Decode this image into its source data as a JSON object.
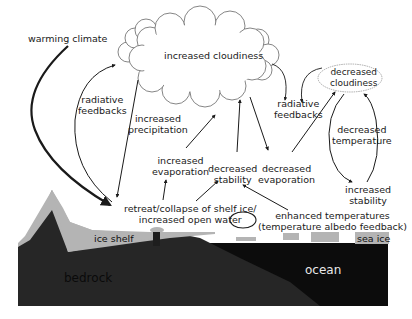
{
  "labels": {
    "warming_climate": "warming climate",
    "increased_cloudiness": "increased cloudiness",
    "decreased_cloudiness_1": "decreased",
    "decreased_cloudiness_2": "cloudiness",
    "radiative_feedbacks_left_1": "radiative",
    "radiative_feedbacks_left_2": "feedbacks",
    "radiative_feedbacks_right_1": "radiative",
    "radiative_feedbacks_right_2": "feedbacks",
    "increased_precipitation_1": "increased",
    "increased_precipitation_2": "precipitation",
    "increased_evaporation_1": "increased",
    "increased_evaporation_2": "evaporation",
    "decreased_stability_1": "decreased",
    "decreased_stability_2": "stability",
    "decreased_evaporation_1": "decreased",
    "decreased_evaporation_2": "evaporation",
    "decreased_temperature_1": "decreased",
    "decreased_temperature_2": "temperature",
    "increased_stability_1": "increased",
    "increased_stability_2": "stability",
    "retreat_1": "retreat/collapse of shelf ice/",
    "retreat_2": "increased open water",
    "enhanced_1": "enhanced temperatures",
    "enhanced_2": "(temperature albedo feedback)",
    "ice_shelf": "ice shelf",
    "sea_ice": "sea ice",
    "bedrock": "bedrock",
    "ocean": "ocean"
  },
  "colors": {
    "bedrock": "#1e1e1e",
    "ocean": "#0c0c0c",
    "ice": "#b4b4b4",
    "cloud_stroke": "#555555",
    "arrow": "#1a1a1a"
  }
}
